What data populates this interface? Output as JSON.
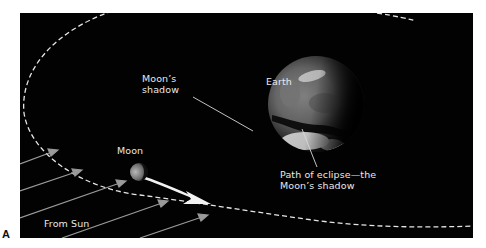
{
  "figure": {
    "letter": "A",
    "background_color": "#020202",
    "label_color": "#e8e8e8",
    "orbit_color": "#e6e6e6",
    "sunray_color": "#9a9a9a",
    "motion_arrow_color": "#f2f2f2"
  },
  "labels": {
    "moons_shadow": {
      "line1": "Moon’s",
      "line2": "shadow"
    },
    "earth": "Earth",
    "moon": "Moon",
    "from_sun": "From Sun",
    "path_of_eclipse": {
      "line1": "Path of eclipse—the",
      "line2": "Moon’s shadow"
    }
  },
  "elements": {
    "orbit": "Moon's orbit (dashed ellipse)",
    "sun_rays": 6,
    "moon_motion_arrow": "direction of Moon's orbital motion"
  }
}
